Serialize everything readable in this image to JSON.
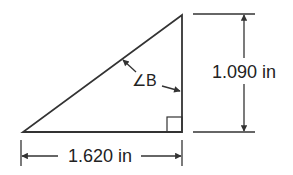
{
  "diagram": {
    "shape": "right-triangle",
    "horizontal_dimension": {
      "label": "1.620 in",
      "value": 1.62,
      "unit": "in"
    },
    "vertical_dimension": {
      "label": "1.090 in",
      "value": 1.09,
      "unit": "in"
    },
    "angle": {
      "label": "∠B"
    },
    "right_angle_marker": true,
    "colors": {
      "line": "#333333",
      "background": "#ffffff",
      "text": "#222222"
    }
  }
}
